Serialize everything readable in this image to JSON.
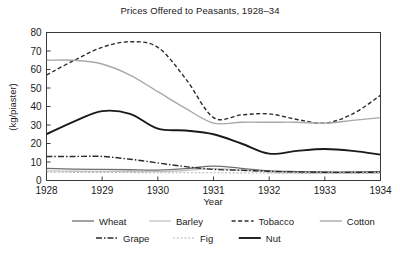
{
  "chart_data": {
    "type": "line",
    "title": "Prices Offered to Peasants, 1928–34",
    "xlabel": "Year",
    "ylabel": "(kg/piaster)",
    "xlim": [
      1928,
      1934
    ],
    "ylim": [
      0,
      80
    ],
    "grid": false,
    "legend_position": "below",
    "xticks": [
      "1928",
      "1929",
      "1930",
      "1931",
      "1932",
      "1933",
      "1934"
    ],
    "yticks": [
      "0",
      "10",
      "20",
      "30",
      "40",
      "50",
      "60",
      "70",
      "80"
    ],
    "x": [
      1928,
      1928.5,
      1929,
      1929.5,
      1930,
      1930.5,
      1931,
      1931.5,
      1932,
      1932.5,
      1933,
      1933.5,
      1934
    ],
    "series": [
      {
        "name": "Wheat",
        "style": "solid",
        "color": "#6e6e6e",
        "width": 1.3,
        "values": [
          6.5,
          6.2,
          6.0,
          5.8,
          5.6,
          6.4,
          7.8,
          6.6,
          5.2,
          4.8,
          4.6,
          4.6,
          4.8
        ]
      },
      {
        "name": "Barley",
        "style": "solid",
        "color": "#c2c2c2",
        "width": 1.3,
        "values": [
          5.2,
          5.0,
          4.9,
          4.8,
          4.8,
          5.4,
          6.4,
          5.6,
          4.6,
          4.2,
          4.0,
          4.0,
          4.1
        ]
      },
      {
        "name": "Tobacco",
        "style": "dashed",
        "color": "#2b2b2b",
        "width": 1.4,
        "values": [
          57,
          65,
          72,
          75,
          72,
          55,
          34,
          35.5,
          36,
          33,
          31,
          36,
          46
        ]
      },
      {
        "name": "Cotton",
        "style": "solid",
        "color": "#a8a8a8",
        "width": 1.4,
        "values": [
          65,
          65,
          63,
          57,
          48,
          39,
          31,
          31.5,
          31.5,
          31.5,
          31,
          32.5,
          34
        ]
      },
      {
        "name": "Grape",
        "style": "dashdot",
        "color": "#2b2b2b",
        "width": 1.4,
        "values": [
          13,
          13,
          13,
          11.5,
          9.5,
          7.5,
          6.0,
          5.5,
          5.0,
          4.6,
          4.4,
          4.4,
          4.5
        ]
      },
      {
        "name": "Fig",
        "style": "finedash",
        "color": "#b5b5b5",
        "width": 1.1,
        "values": [
          4.5,
          4.4,
          4.4,
          4.3,
          4.2,
          4.2,
          4.2,
          4.1,
          4.0,
          3.9,
          3.8,
          3.8,
          3.8
        ]
      },
      {
        "name": "Nut",
        "style": "solid",
        "color": "#1a1a1a",
        "width": 1.9,
        "values": [
          25,
          32,
          37.5,
          36,
          28,
          27,
          25,
          20,
          14.5,
          16,
          17,
          16,
          14
        ]
      }
    ]
  },
  "legend": {
    "row1": [
      "Wheat",
      "Barley",
      "Tobacco",
      "Cotton"
    ],
    "row2": [
      "Grape",
      "Fig",
      "Nut"
    ]
  }
}
